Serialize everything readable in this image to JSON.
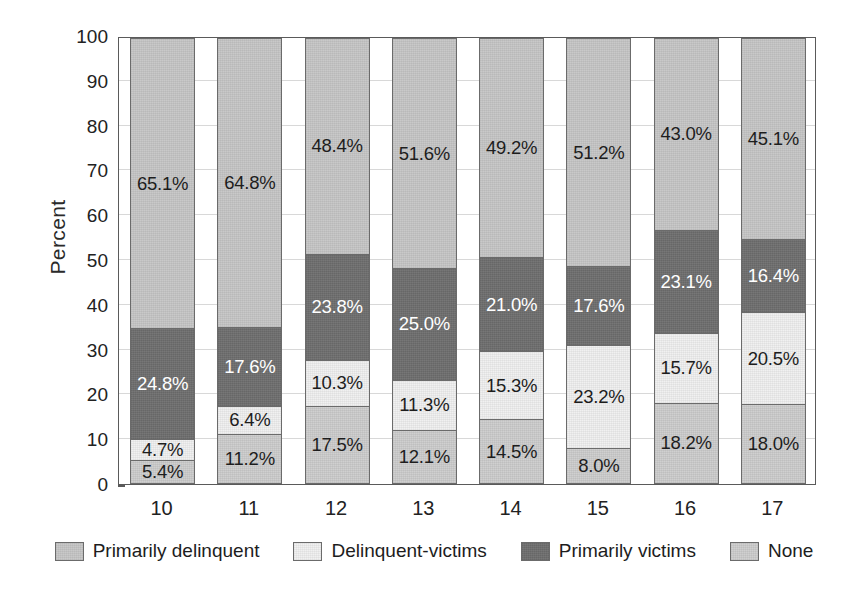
{
  "chart_data": {
    "type": "bar",
    "stacked": true,
    "title": "",
    "xlabel": "",
    "ylabel": "Percent",
    "ylim": [
      0,
      100
    ],
    "yticks": [
      0,
      10,
      20,
      30,
      40,
      50,
      60,
      70,
      80,
      90,
      100
    ],
    "ytick_labels": [
      "0",
      "10",
      "20",
      "30",
      "40",
      "50",
      "60",
      "70",
      "80",
      "90",
      "100"
    ],
    "grid": true,
    "legend_position": "bottom",
    "categories": [
      "10",
      "11",
      "12",
      "13",
      "14",
      "15",
      "16",
      "17"
    ],
    "series": [
      {
        "name": "None",
        "color": "#cdcdcd",
        "label_color": "dark",
        "stack_order": 1,
        "values": [
          5.4,
          11.2,
          17.5,
          12.1,
          14.5,
          8.0,
          18.2,
          18.0
        ],
        "labels": [
          "5.4%",
          "11.2%",
          "17.5%",
          "12.1%",
          "14.5%",
          "8.0%",
          "18.2%",
          "18.0%"
        ]
      },
      {
        "name": "Delinquent-victims",
        "color": "#f0f0f0",
        "label_color": "dark",
        "stack_order": 2,
        "values": [
          4.7,
          6.4,
          10.3,
          11.3,
          15.3,
          23.2,
          15.7,
          20.5
        ],
        "labels": [
          "4.7%",
          "6.4%",
          "10.3%",
          "11.3%",
          "15.3%",
          "23.2%",
          "15.7%",
          "20.5%"
        ]
      },
      {
        "name": "Primarily victims",
        "color": "#6e6e6e",
        "label_color": "light",
        "stack_order": 3,
        "values": [
          24.8,
          17.6,
          23.8,
          25.0,
          21.0,
          17.6,
          23.1,
          16.4
        ],
        "labels": [
          "24.8%",
          "17.6%",
          "23.8%",
          "25.0%",
          "21.0%",
          "17.6%",
          "23.1%",
          "16.4%"
        ]
      },
      {
        "name": "Primarily delinquent",
        "color": "#c6c6c6",
        "label_color": "dark",
        "stack_order": 4,
        "values": [
          65.1,
          64.8,
          48.4,
          51.6,
          49.2,
          51.2,
          43.0,
          45.1
        ],
        "labels": [
          "65.1%",
          "64.8%",
          "48.4%",
          "51.6%",
          "49.2%",
          "51.2%",
          "43.0%",
          "45.1%"
        ]
      }
    ],
    "legend_entries": [
      {
        "label": "Primarily delinquent",
        "color": "#c6c6c6"
      },
      {
        "label": "Delinquent-victims",
        "color": "#f0f0f0"
      },
      {
        "label": "Primarily victims",
        "color": "#6e6e6e"
      },
      {
        "label": "None",
        "color": "#cdcdcd"
      }
    ]
  }
}
